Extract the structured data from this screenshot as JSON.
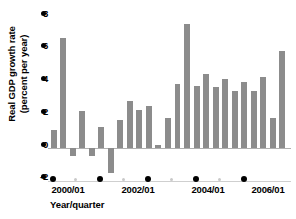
{
  "chart_data": {
    "type": "bar",
    "title": "",
    "xlabel": "Year/quarter",
    "ylabel": "Real GDP growth rate\n(percent per year)",
    "ylim": [
      -2,
      8
    ],
    "yticks": [
      -2,
      0,
      2,
      4,
      6,
      8
    ],
    "ytick_labels": [
      "-2",
      "0",
      "2",
      "4",
      "6",
      "8"
    ],
    "xtick_labels": [
      "2000/01",
      "2002/01",
      "2004/01",
      "2006/01"
    ],
    "xtick_positions": [
      0,
      8,
      16,
      24
    ],
    "grid": false,
    "legend": null,
    "bar_color": "#8c8c8c",
    "axis_color": "#000000",
    "categories": [
      "2000/01",
      "2000/02",
      "2000/03",
      "2000/04",
      "2001/01",
      "2001/02",
      "2001/03",
      "2001/04",
      "2002/01",
      "2002/02",
      "2002/03",
      "2002/04",
      "2003/01",
      "2003/02",
      "2003/03",
      "2003/04",
      "2004/01",
      "2004/02",
      "2004/03",
      "2004/04",
      "2005/01",
      "2005/02",
      "2005/03",
      "2005/04",
      "2006/01"
    ],
    "values": [
      1.0,
      6.4,
      -0.5,
      2.1,
      -0.5,
      1.2,
      -1.5,
      1.6,
      2.7,
      2.2,
      2.4,
      0.15,
      1.7,
      3.7,
      7.2,
      3.6,
      4.3,
      3.5,
      4.0,
      3.3,
      3.8,
      3.3,
      4.1,
      1.7,
      5.6
    ]
  },
  "yticks": {
    "t8": "8",
    "t6": "6",
    "t4": "4",
    "t2": "2",
    "t0": "0",
    "tm2": "-2"
  },
  "xticks": {
    "l0": "2000/01",
    "l1": "2002/01",
    "l2": "2004/01",
    "l3": "2006/01"
  },
  "axis_titles": {
    "x": "Year/quarter",
    "y": "Real GDP growth rate\n(percent per year)"
  }
}
